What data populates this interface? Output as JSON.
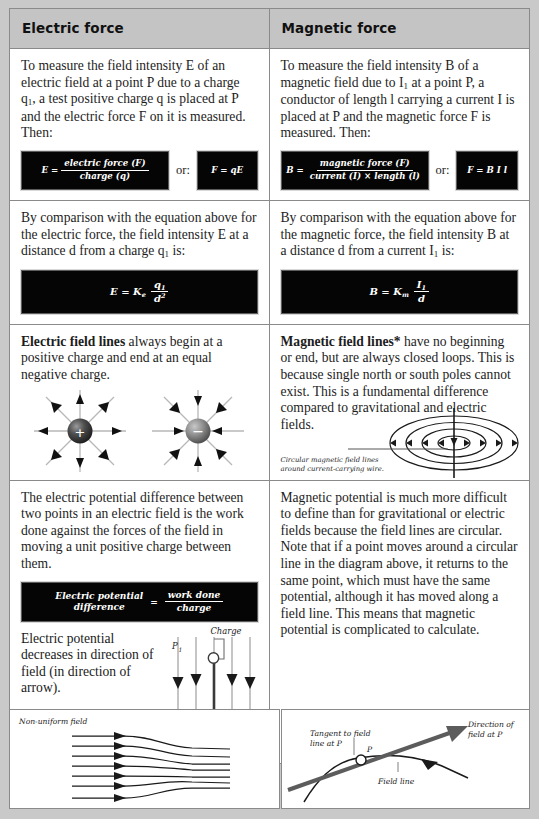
{
  "table": {
    "headers": {
      "electric": "Electric force",
      "magnetic": "Magnetic force"
    },
    "rows": [
      {
        "id": "field-intensity-definition",
        "electric": {
          "paragraph": "To measure the field intensity E of an electric field at a point P due to a charge q1, a test positive charge q is placed at P and the electric force F on it is measured. Then:",
          "equation_main_lhs": "E =",
          "equation_main_numerator": "electric force (F)",
          "equation_main_denominator": "charge (q)",
          "or_label": "or:",
          "equation_alt": "F = qE"
        },
        "magnetic": {
          "paragraph": "To measure the field intensity B of a magnetic field due to I1 at a point P, a conductor of length l carrying a current I is placed at P and the magnetic force F is measured. Then:",
          "equation_main_lhs": "B =",
          "equation_main_numerator": "magnetic force (F)",
          "equation_main_denominator": "current (I) × length (l)",
          "or_label": "or:",
          "equation_alt": "F = B I l"
        }
      },
      {
        "id": "field-intensity-distance",
        "electric": {
          "paragraph": "By comparison with the equation above for the electric force, the field intensity E at a distance d from a charge q1 is:",
          "equation": "E = Ke q1 / d2",
          "equation_lhs": "E = K",
          "equation_lhs_sub": "e",
          "equation_num": "q",
          "equation_num_sub": "1",
          "equation_den": "d",
          "equation_den_sup": "2"
        },
        "magnetic": {
          "paragraph": "By comparison with the equation above for the magnetic force, the field intensity B at a distance d from a current I1 is:",
          "equation": "B = Km I1 / d",
          "equation_lhs": "B = K",
          "equation_lhs_sub": "m",
          "equation_num": "I",
          "equation_num_sub": "1",
          "equation_den": "d",
          "equation_den_sup": ""
        }
      },
      {
        "id": "field-lines",
        "electric": {
          "lead": "Electric field lines",
          "paragraph": " always begin at a positive charge and end at an equal negative charge.",
          "diagram_positive_symbol": "+",
          "diagram_negative_symbol": "−"
        },
        "magnetic": {
          "lead": "Magnetic field lines*",
          "paragraph": " have no beginning or end, but are always closed loops. This is because single north or south poles cannot exist. This is a fundamental difference compared to gravitational and electric fields.",
          "caption": "Circular magnetic field lines around current-carrying wire."
        }
      },
      {
        "id": "potential",
        "electric": {
          "paragraph": "The electric potential difference between two points in an electric field is the work done against the forces of the field in moving a unit positive charge between them.",
          "equation_lhs_line1": "Electric potential",
          "equation_lhs_line2": "difference",
          "equation_eq": "=",
          "equation_num": "work done",
          "equation_den": "charge",
          "paragraph2": "Electric potential decreases in direction of field (in direction of arrow).",
          "paragraph3": "Electric potential higher at point P1 than at P2.",
          "label_charge": "Charge",
          "label_p1": "P1",
          "label_p2": "P2"
        },
        "magnetic": {
          "paragraph": "Magnetic potential is much more difficult to define than for gravitational or electric fields because the field lines are circular. Note that if a point moves around a circular line in the diagram above, it returns to the same point, which must have the same potential, although it has moved along a field line. This means that magnetic potential is complicated to calculate."
        }
      }
    ]
  },
  "bottom_panels": {
    "left": {
      "caption": "Non-uniform field"
    },
    "right": {
      "label_tangent": "Tangent to field line at P",
      "label_point": "P",
      "label_field_line": "Field line",
      "label_direction": "Direction of field at P"
    }
  },
  "colors": {
    "page_background": "#c9c9c9",
    "cell_background": "#ffffff",
    "header_background": "#c4c4c4",
    "border": "#8a8a8a",
    "equation_box": "#050505",
    "text": "#1d1d1d"
  }
}
